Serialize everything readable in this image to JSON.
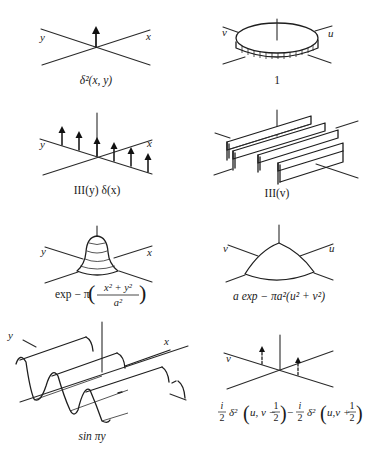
{
  "figure": {
    "panels": [
      {
        "id": "delta2",
        "axis_labels": {
          "left": "y",
          "right": "x"
        },
        "caption": "δ²(x, y)"
      },
      {
        "id": "one",
        "axis_labels": {
          "left": "v",
          "right": "u"
        },
        "caption": "1"
      },
      {
        "id": "shah-y-delta-x",
        "axis_labels": {
          "left": "y",
          "right": "x"
        },
        "caption": "III(y) δ(x)"
      },
      {
        "id": "shah-v",
        "axis_labels": {
          "left": "",
          "right": ""
        },
        "caption": "III(v)"
      },
      {
        "id": "gaussian",
        "axis_labels": {
          "left": "y",
          "right": "x"
        },
        "caption": {
          "prefix": "exp − π",
          "numerator": "x² + y²",
          "denominator": "a²"
        }
      },
      {
        "id": "gaussian-transform",
        "axis_labels": {
          "left": "v",
          "right": "u"
        },
        "caption": "a exp − πa²(u² + v²)"
      },
      {
        "id": "sine",
        "axis_labels": {
          "left": "y",
          "right": "x"
        },
        "caption": "sin πy"
      },
      {
        "id": "sine-transform",
        "axis_labels": {
          "left": "v",
          "right": ""
        },
        "caption": {
          "term1_coef_num": "i",
          "term1_coef_den": "2",
          "term1_fn": "δ²",
          "term1_arg": "u, v −",
          "half_num": "1",
          "half_den": "2",
          "minus": "−",
          "term2_coef_num": "i",
          "term2_coef_den": "2",
          "term2_fn": "δ²",
          "term2_arg": "u,v +"
        }
      }
    ]
  }
}
